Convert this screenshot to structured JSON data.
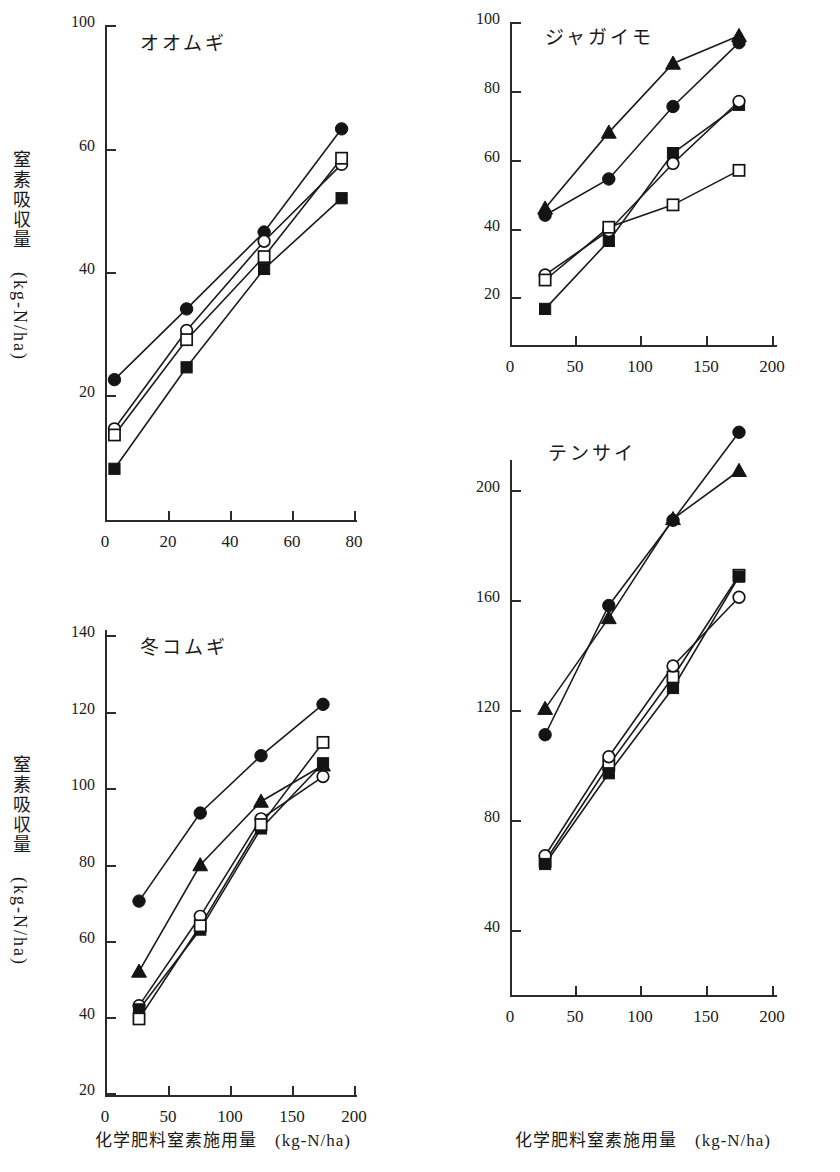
{
  "figure": {
    "axis_x_caption": "化学肥料窒素施用量　(kg-N/ha)",
    "axis_y_caption_main": "窒素吸収量",
    "axis_y_caption_unit": "(kg-N/ha)"
  },
  "chart_data": [
    {
      "id": "barley",
      "type": "line",
      "title": "オオムギ",
      "xlabel": "化学肥料窒素施用量　(kg-N/ha)",
      "ylabel": "窒素吸収量　(kg-N/ha)",
      "xlim": [
        0,
        80
      ],
      "ylim": [
        0,
        100
      ],
      "xticks": [
        0,
        20,
        40,
        60,
        80
      ],
      "yticks": [
        20,
        40,
        60,
        100
      ],
      "grid": false,
      "legend": "none",
      "x": [
        3,
        26,
        51,
        76
      ],
      "series": [
        {
          "name": "filled-circle",
          "marker": "filled-circle",
          "values": [
            22.5,
            34.0,
            46.5,
            66.5
          ]
        },
        {
          "name": "open-circle",
          "marker": "open-circle",
          "values": [
            14.5,
            30.5,
            45.0,
            57.5
          ]
        },
        {
          "name": "open-square",
          "marker": "open-square",
          "values": [
            13.5,
            29.0,
            42.5,
            58.5
          ]
        },
        {
          "name": "filled-square",
          "marker": "filled-square",
          "values": [
            8.0,
            24.5,
            40.5,
            52.0
          ]
        }
      ]
    },
    {
      "id": "potato",
      "type": "line",
      "title": "ジャガイモ",
      "xlabel": "化学肥料窒素施用量　(kg-N/ha)",
      "ylabel": "窒素吸収量　(kg-N/ha)",
      "xlim": [
        0,
        200
      ],
      "ylim": [
        0,
        100
      ],
      "xticks": [
        0,
        50,
        100,
        150,
        200
      ],
      "yticks": [
        20,
        40,
        60,
        80,
        100
      ],
      "grid": false,
      "legend": "none",
      "x": [
        27,
        76,
        125,
        175
      ],
      "series": [
        {
          "name": "filled-triangle",
          "marker": "filled-triangle",
          "values": [
            46.0,
            68.0,
            88.0,
            96.0
          ]
        },
        {
          "name": "filled-circle",
          "marker": "filled-circle",
          "values": [
            44.0,
            54.5,
            75.5,
            94.0
          ]
        },
        {
          "name": "filled-square",
          "marker": "filled-square",
          "values": [
            16.5,
            36.5,
            62.0,
            76.0
          ]
        },
        {
          "name": "open-circle",
          "marker": "open-circle",
          "values": [
            26.5,
            39.5,
            59.0,
            77.0
          ]
        },
        {
          "name": "open-square",
          "marker": "open-square",
          "values": [
            25.0,
            40.5,
            47.0,
            57.0
          ]
        }
      ]
    },
    {
      "id": "winter-wheat",
      "type": "line",
      "title": "冬コムギ",
      "xlabel": "化学肥料窒素施用量　(kg-N/ha)",
      "ylabel": "窒素吸収量　(kg-N/ha)",
      "xlim": [
        0,
        200
      ],
      "ylim": [
        0,
        140
      ],
      "xticks": [
        0,
        50,
        100,
        150,
        200
      ],
      "yticks": [
        20,
        40,
        60,
        80,
        100,
        120,
        140
      ],
      "grid": false,
      "legend": "none",
      "x": [
        27,
        76,
        125,
        175
      ],
      "series": [
        {
          "name": "filled-circle",
          "marker": "filled-circle",
          "values": [
            70.5,
            93.5,
            108.5,
            122.0
          ]
        },
        {
          "name": "filled-triangle",
          "marker": "filled-triangle",
          "values": [
            52.0,
            80.0,
            96.5,
            106.0
          ]
        },
        {
          "name": "open-circle",
          "marker": "open-circle",
          "values": [
            43.0,
            66.5,
            92.0,
            103.0
          ]
        },
        {
          "name": "filled-square",
          "marker": "filled-square",
          "values": [
            42.0,
            63.0,
            89.5,
            106.5
          ]
        },
        {
          "name": "open-square",
          "marker": "open-square",
          "values": [
            39.5,
            64.0,
            90.5,
            112.0
          ]
        }
      ]
    },
    {
      "id": "sugar-beet",
      "type": "line",
      "title": "テンサイ",
      "xlabel": "化学肥料窒素施用量　(kg-N/ha)",
      "ylabel": "窒素吸収量　(kg-N/ha)",
      "xlim": [
        0,
        200
      ],
      "ylim": [
        0,
        225
      ],
      "xticks": [
        0,
        50,
        100,
        150,
        200
      ],
      "yticks": [
        40,
        80,
        120,
        160,
        200
      ],
      "grid": false,
      "legend": "none",
      "x": [
        27,
        76,
        125,
        175
      ],
      "series": [
        {
          "name": "filled-circle",
          "marker": "filled-circle",
          "values": [
            111.0,
            158.0,
            189.0,
            221.0
          ]
        },
        {
          "name": "filled-triangle",
          "marker": "filled-triangle",
          "values": [
            120.5,
            153.5,
            189.5,
            207.0
          ]
        },
        {
          "name": "open-square",
          "marker": "open-square",
          "values": [
            65.0,
            100.0,
            132.0,
            169.0
          ]
        },
        {
          "name": "open-circle",
          "marker": "open-circle",
          "values": [
            67.0,
            103.0,
            136.0,
            161.0
          ]
        },
        {
          "name": "filled-square",
          "marker": "filled-square",
          "values": [
            64.0,
            97.0,
            128.0,
            168.5
          ]
        }
      ]
    }
  ]
}
